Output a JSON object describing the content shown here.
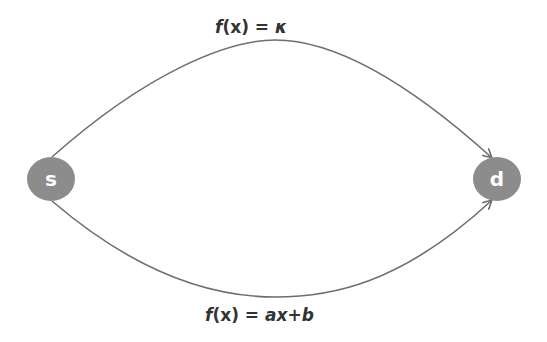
{
  "diagram": {
    "nodes": [
      {
        "id": "s",
        "label": "s",
        "cx": 51,
        "cy": 179
      },
      {
        "id": "d",
        "label": "d",
        "cx": 497,
        "cy": 179
      }
    ],
    "edges": [
      {
        "from": "s",
        "to": "d",
        "route": "upper",
        "label": "f(x) = κ",
        "cost_function": "κ"
      },
      {
        "from": "s",
        "to": "d",
        "route": "lower",
        "label": "f(x) = ax+b",
        "cost_function": "ax+b"
      }
    ],
    "labels": {
      "upper_edge": {
        "prefix": "f",
        "arg": "(x) = ",
        "expr": "κ"
      },
      "lower_edge": {
        "prefix": "f",
        "arg": "(x) = ",
        "expr": "ax+b"
      }
    },
    "colors": {
      "node_fill": "#8c8c8c",
      "edge_stroke": "#6e6e6e",
      "node_text": "#ffffff",
      "label_text": "#333333"
    }
  }
}
